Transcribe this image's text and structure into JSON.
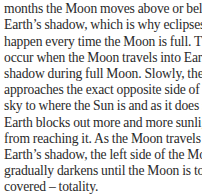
{
  "article": {
    "paragraph_lines": [
      "",
      "months the Moon moves above or below",
      "Earth’s shadow, which is why eclipses don’t",
      "happen every time the Moon is full. They",
      "occur when the Moon travels into Earth’s",
      "shadow during full Moon. Slowly, the Moon",
      "approaches the exact opposite side of the",
      "sky to where the Sun is and as it does so",
      "Earth blocks out more and more sunlight",
      "from reaching it. As the Moon travels into",
      "Earth’s shadow, the left side of the Moon",
      "gradually darkens until the Moon is totally",
      "covered – totality."
    ]
  }
}
